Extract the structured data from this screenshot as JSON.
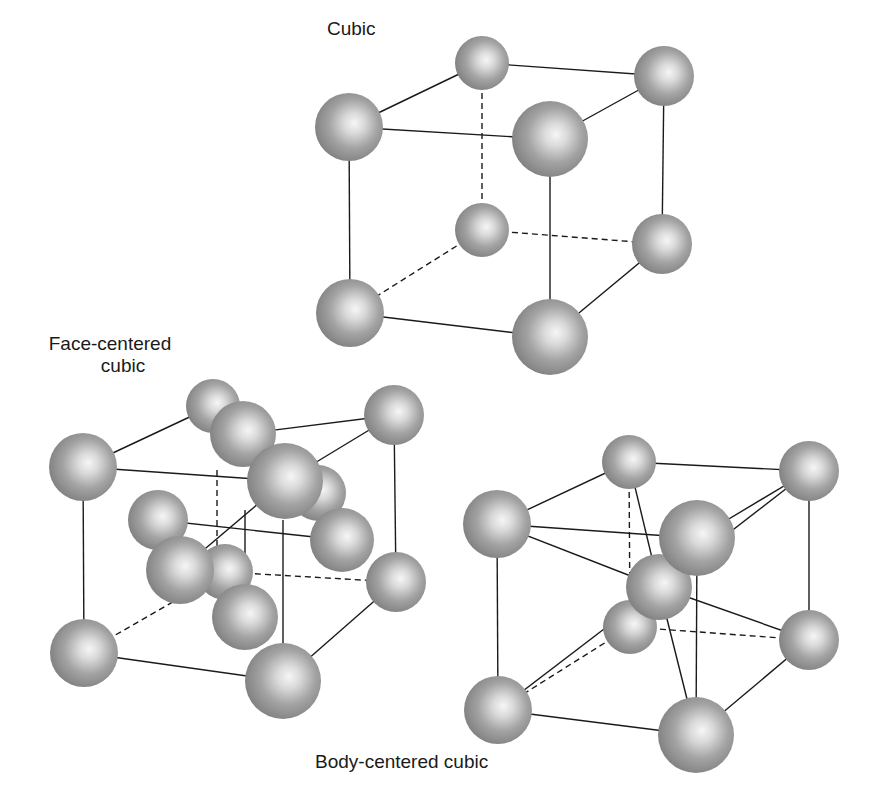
{
  "figure": {
    "labels": {
      "cubic": "Cubic",
      "fcc_line1": "Face-centered",
      "fcc_line2": "cubic",
      "bcc": "Body-centered cubic"
    },
    "colors": {
      "sphere_edge": "#7f7f7f",
      "sphere_mid": "#9c9c9c",
      "sphere_highlight": "#f4f4f4",
      "bond": "#1a1a1a",
      "text": "#1a1a1a",
      "background": "#ffffff"
    }
  },
  "lattices": [
    {
      "id": "cubic",
      "name": "Cubic",
      "atoms": [
        {
          "id": "tbl",
          "x": 482,
          "y": 63,
          "r": 27
        },
        {
          "id": "tbr",
          "x": 664,
          "y": 76,
          "r": 30
        },
        {
          "id": "bbl",
          "x": 482,
          "y": 230,
          "r": 27
        },
        {
          "id": "bbr",
          "x": 662,
          "y": 244,
          "r": 30
        },
        {
          "id": "tfl",
          "x": 349,
          "y": 127,
          "r": 34
        },
        {
          "id": "tfr",
          "x": 550,
          "y": 139,
          "r": 38
        },
        {
          "id": "bfl",
          "x": 350,
          "y": 313,
          "r": 34
        },
        {
          "id": "bfr",
          "x": 550,
          "y": 337,
          "r": 38
        }
      ],
      "bonds": [
        {
          "a": "tfl",
          "b": "tbl",
          "dashed": false
        },
        {
          "a": "tbl",
          "b": "tbr",
          "dashed": false
        },
        {
          "a": "tfr",
          "b": "tbr",
          "dashed": false
        },
        {
          "a": "tfl",
          "b": "tfr",
          "dashed": false
        },
        {
          "a": "tfl",
          "b": "bfl",
          "dashed": false
        },
        {
          "a": "tfr",
          "b": "bfr",
          "dashed": false
        },
        {
          "a": "tbr",
          "b": "bbr",
          "dashed": false
        },
        {
          "a": "bfl",
          "b": "bfr",
          "dashed": false
        },
        {
          "a": "bfr",
          "b": "bbr",
          "dashed": false
        },
        {
          "a": "tbl",
          "b": "bbl",
          "dashed": true
        },
        {
          "a": "bbl",
          "b": "bbr",
          "dashed": true
        },
        {
          "a": "bbl",
          "b": "bfl",
          "dashed": true
        }
      ],
      "draw_order": [
        "bbl",
        "tbl",
        "bbr",
        "tbr",
        "tfl",
        "bfl",
        "tfr",
        "bfr"
      ]
    },
    {
      "id": "fcc",
      "name": "Face-centered cubic",
      "atoms": [
        {
          "id": "tbl",
          "x": 213,
          "y": 406,
          "r": 27
        },
        {
          "id": "tbr",
          "x": 394,
          "y": 415,
          "r": 30
        },
        {
          "id": "bbl",
          "x": 225,
          "y": 572,
          "r": 28
        },
        {
          "id": "bbr",
          "x": 396,
          "y": 582,
          "r": 30
        },
        {
          "id": "tfl",
          "x": 83,
          "y": 467,
          "r": 34
        },
        {
          "id": "tfr",
          "x": 285,
          "y": 481,
          "r": 38
        },
        {
          "id": "bfl",
          "x": 84,
          "y": 653,
          "r": 34
        },
        {
          "id": "bfr",
          "x": 283,
          "y": 681,
          "r": 38
        },
        {
          "id": "f_top",
          "x": 243,
          "y": 434,
          "r": 33
        },
        {
          "id": "f_left",
          "x": 158,
          "y": 520,
          "r": 30
        },
        {
          "id": "f_right",
          "x": 342,
          "y": 540,
          "r": 32
        },
        {
          "id": "f_back",
          "x": 318,
          "y": 493,
          "r": 28
        },
        {
          "id": "f_front",
          "x": 180,
          "y": 570,
          "r": 34
        },
        {
          "id": "f_bottom",
          "x": 245,
          "y": 617,
          "r": 33
        }
      ],
      "bonds": [
        {
          "a": "tfl",
          "b": "tbl",
          "dashed": false
        },
        {
          "a": "f_top",
          "b": "tbr",
          "dashed": false
        },
        {
          "a": "tfr",
          "b": "tbr",
          "dashed": false
        },
        {
          "a": "tfl",
          "b": "tfr",
          "dashed": false
        },
        {
          "a": "tfl",
          "b": "bfl",
          "dashed": false
        },
        {
          "a": "tbr",
          "b": "bbr",
          "dashed": false
        },
        {
          "a": "bfl",
          "b": "bfr",
          "dashed": false
        },
        {
          "a": "bfr",
          "b": "bbr",
          "dashed": false
        },
        {
          "a": "f_left",
          "b": "f_right",
          "dashed": false
        },
        {
          "a": "tfr",
          "b": "f_front",
          "dashed": false
        },
        {
          "a": "tfr",
          "b": "f_bottom",
          "dashed": false,
          "x1": 245,
          "y1": 510,
          "x2": 245,
          "y2": 590
        },
        {
          "a": "f_back",
          "b": "bfr",
          "dashed": false,
          "x1": 283,
          "y1": 520,
          "x2": 283,
          "y2": 645
        },
        {
          "a": "tbl",
          "b": "bbl",
          "dashed": true,
          "x1": 217,
          "y1": 470,
          "x2": 217,
          "y2": 548
        },
        {
          "a": "bbl",
          "b": "bbr",
          "dashed": true
        },
        {
          "a": "bbl",
          "b": "bfl",
          "dashed": true
        }
      ],
      "draw_order": [
        "bbl",
        "tbl",
        "bbr",
        "tbr",
        "f_left",
        "f_top",
        "f_back",
        "f_right",
        "tfl",
        "tfr",
        "f_front",
        "f_bottom",
        "bfl",
        "bfr"
      ]
    },
    {
      "id": "bcc",
      "name": "Body-centered cubic",
      "atoms": [
        {
          "id": "tbl",
          "x": 629,
          "y": 462,
          "r": 27
        },
        {
          "id": "tbr",
          "x": 809,
          "y": 471,
          "r": 30
        },
        {
          "id": "bbl",
          "x": 630,
          "y": 627,
          "r": 27
        },
        {
          "id": "bbr",
          "x": 809,
          "y": 640,
          "r": 30
        },
        {
          "id": "tfl",
          "x": 497,
          "y": 524,
          "r": 34
        },
        {
          "id": "tfr",
          "x": 697,
          "y": 538,
          "r": 38
        },
        {
          "id": "bfl",
          "x": 498,
          "y": 710,
          "r": 34
        },
        {
          "id": "bfr",
          "x": 696,
          "y": 735,
          "r": 38
        },
        {
          "id": "center",
          "x": 659,
          "y": 587,
          "r": 33
        }
      ],
      "bonds": [
        {
          "a": "tfl",
          "b": "tbl",
          "dashed": false
        },
        {
          "a": "tbl",
          "b": "tbr",
          "dashed": false
        },
        {
          "a": "tfr",
          "b": "tbr",
          "dashed": false
        },
        {
          "a": "tfl",
          "b": "tfr",
          "dashed": false
        },
        {
          "a": "tfl",
          "b": "bfl",
          "dashed": false
        },
        {
          "a": "tfr",
          "b": "bfr",
          "dashed": false
        },
        {
          "a": "tbr",
          "b": "bbr",
          "dashed": false
        },
        {
          "a": "bfl",
          "b": "bfr",
          "dashed": false
        },
        {
          "a": "bfr",
          "b": "bbr",
          "dashed": false
        },
        {
          "a": "tbl",
          "b": "bbl",
          "dashed": true
        },
        {
          "a": "bbl",
          "b": "bbr",
          "dashed": true
        },
        {
          "a": "bbl",
          "b": "bfl",
          "dashed": true
        },
        {
          "a": "center",
          "b": "tfl",
          "dashed": false
        },
        {
          "a": "center",
          "b": "tbl",
          "dashed": false
        },
        {
          "a": "center",
          "b": "tbr",
          "dashed": false
        },
        {
          "a": "center",
          "b": "bfl",
          "dashed": false
        },
        {
          "a": "center",
          "b": "bbr",
          "dashed": false
        },
        {
          "a": "center",
          "b": "bfr",
          "dashed": false
        },
        {
          "a": "center",
          "b": "bbl",
          "dashed": false
        }
      ],
      "draw_order": [
        "bbl",
        "tbl",
        "bbr",
        "tbr",
        "tfl",
        "bfl",
        "center",
        "tfr",
        "bfr"
      ]
    }
  ]
}
